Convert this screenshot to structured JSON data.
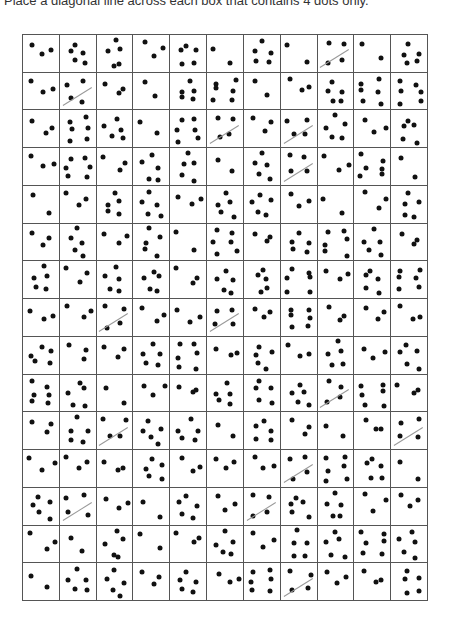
{
  "instruction": "Place a diagonal line across each box that contains 4 dots only.",
  "grid": {
    "columns": 11,
    "rows": 15,
    "target_count": 4,
    "dot_counts": [
      [
        3,
        5,
        5,
        3,
        5,
        2,
        5,
        2,
        4,
        2,
        5
      ],
      [
        3,
        4,
        3,
        2,
        5,
        6,
        2,
        3,
        5,
        6,
        6
      ],
      [
        3,
        6,
        5,
        2,
        6,
        4,
        3,
        4,
        5,
        3,
        5
      ],
      [
        3,
        6,
        3,
        5,
        5,
        2,
        5,
        4,
        3,
        6,
        2
      ],
      [
        2,
        3,
        5,
        5,
        3,
        5,
        5,
        3,
        2,
        3,
        5
      ],
      [
        3,
        5,
        3,
        5,
        2,
        6,
        3,
        5,
        6,
        5,
        3
      ],
      [
        5,
        3,
        5,
        5,
        3,
        5,
        5,
        6,
        3,
        5,
        6
      ],
      [
        3,
        3,
        4,
        3,
        3,
        4,
        3,
        6,
        3,
        3,
        3
      ],
      [
        5,
        3,
        3,
        5,
        6,
        3,
        5,
        3,
        5,
        3,
        5
      ],
      [
        6,
        5,
        2,
        3,
        3,
        5,
        5,
        5,
        4,
        6,
        3
      ],
      [
        3,
        5,
        4,
        5,
        5,
        2,
        5,
        3,
        2,
        3,
        4
      ],
      [
        3,
        3,
        3,
        5,
        3,
        3,
        3,
        4,
        6,
        5,
        2
      ],
      [
        5,
        4,
        3,
        2,
        5,
        3,
        4,
        5,
        5,
        3,
        3
      ],
      [
        3,
        2,
        5,
        2,
        3,
        5,
        3,
        5,
        5,
        6,
        5
      ],
      [
        2,
        5,
        5,
        3,
        5,
        3,
        6,
        4,
        3,
        3,
        5
      ]
    ],
    "slashed": [
      [
        0,
        8
      ],
      [
        1,
        1
      ],
      [
        2,
        5
      ],
      [
        2,
        7
      ],
      [
        3,
        7
      ],
      [
        7,
        2
      ],
      [
        7,
        5
      ],
      [
        9,
        8
      ],
      [
        10,
        2
      ],
      [
        10,
        10
      ],
      [
        11,
        7
      ],
      [
        12,
        1
      ],
      [
        12,
        6
      ],
      [
        14,
        7
      ]
    ]
  }
}
